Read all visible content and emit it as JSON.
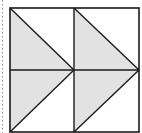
{
  "diagram": {
    "colors": {
      "background": "#ffffff",
      "stroke": "#1a1a1a",
      "fill": "#e2e2e2",
      "dotted_line": "#888888"
    },
    "square": {
      "x1": 10,
      "y1": 8,
      "x2": 139,
      "y2": 132
    },
    "center": {
      "x": 74,
      "y": 70
    },
    "shaded_triangles": [
      {
        "name": "top-left",
        "points": "10,8 74,70 10,70"
      },
      {
        "name": "top-right",
        "points": "74,8 139,70 74,70"
      },
      {
        "name": "bottom-left",
        "points": "10,70 74,70 10,132"
      },
      {
        "name": "bottom-right",
        "points": "74,70 139,70 74,132"
      }
    ]
  }
}
